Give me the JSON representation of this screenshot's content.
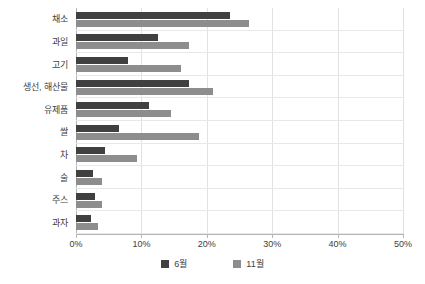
{
  "chart_data": {
    "type": "bar",
    "orientation": "horizontal",
    "title": "",
    "xlabel": "",
    "ylabel": "",
    "xlim": [
      0,
      50
    ],
    "xticks": [
      0,
      10,
      20,
      30,
      40,
      50
    ],
    "xtick_labels": [
      "0%",
      "10%",
      "20%",
      "30%",
      "40%",
      "50%"
    ],
    "grid": true,
    "legend_position": "bottom",
    "categories": [
      "채소",
      "과일",
      "고기",
      "생선, 해산물",
      "유제품",
      "쌀",
      "차",
      "술",
      "주스",
      "과자"
    ],
    "series": [
      {
        "name": "6월",
        "color": "#404040",
        "values": [
          23.5,
          12.6,
          8.0,
          17.3,
          11.2,
          6.6,
          4.5,
          2.6,
          2.9,
          2.3
        ]
      },
      {
        "name": "11월",
        "color": "#8d8d8d",
        "values": [
          26.5,
          17.3,
          16.0,
          20.9,
          14.5,
          18.8,
          9.4,
          4.0,
          4.0,
          3.4
        ]
      }
    ]
  },
  "legend": {
    "items": [
      {
        "label": "6월",
        "color": "#404040"
      },
      {
        "label": "11월",
        "color": "#8d8d8d"
      }
    ]
  }
}
